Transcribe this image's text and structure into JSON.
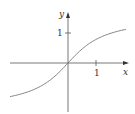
{
  "chart_data": {
    "type": "line",
    "title": "",
    "xlabel": "x",
    "ylabel": "y",
    "function": "y = arctan(x)",
    "x_ticks": [
      {
        "value": 1,
        "label": "1"
      }
    ],
    "y_ticks": [
      {
        "value": 1,
        "label": "1"
      }
    ],
    "xlim": [
      -2.07,
      2.07
    ],
    "ylim": [
      -1.7,
      1.7
    ],
    "grid": false,
    "series": [
      {
        "name": "curve",
        "x": [
          -2.07,
          -1.5,
          -1.0,
          -0.5,
          0,
          0.5,
          1.0,
          1.5,
          2.07
        ],
        "values": [
          -1.12,
          -0.98,
          -0.79,
          -0.46,
          0,
          0.46,
          0.79,
          0.98,
          1.12
        ]
      }
    ],
    "color": "#555555"
  },
  "labels": {
    "x_axis": "x",
    "y_axis": "y",
    "x_tick": "1",
    "y_tick": "1"
  }
}
